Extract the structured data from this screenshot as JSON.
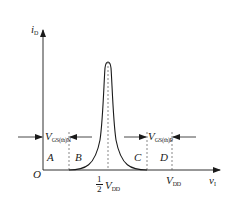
{
  "diagram": {
    "axes": {
      "y_label": "i",
      "y_label_sub": "D",
      "x_label": "v",
      "x_label_sub": "I",
      "origin_label": "O"
    },
    "regions": [
      {
        "id": "A",
        "label": "A"
      },
      {
        "id": "B",
        "label": "B"
      },
      {
        "id": "C",
        "label": "C"
      },
      {
        "id": "D",
        "label": "D"
      }
    ],
    "thresholds": {
      "left": {
        "label": "V",
        "sub": "GS(th)N"
      },
      "right": {
        "label": "V",
        "sub": "GS(th)P"
      }
    },
    "x_ticks": {
      "half_vdd": {
        "num": "1",
        "den": "2",
        "label": "V",
        "sub": "DD"
      },
      "vdd": {
        "label": "V",
        "sub": "DD"
      }
    },
    "colors": {
      "line": "#1a1a1a",
      "dashed": "#555555",
      "background": "#ffffff"
    }
  }
}
